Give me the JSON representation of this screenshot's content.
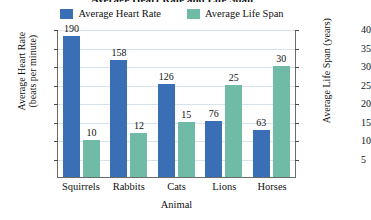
{
  "chart_data": {
    "type": "bar",
    "title": "Average Heart Rate and Life Span",
    "xlabel": "Animal",
    "categories": [
      "Squirrels",
      "Rabbits",
      "Cats",
      "Lions",
      "Horses"
    ],
    "series": [
      {
        "name": "Average Heart Rate",
        "color": "#3a6fb5",
        "axis": "left",
        "ylabel": "Average Heart Rate (beats per minute)",
        "ylim": [
          0,
          200
        ],
        "ticks": [
          200,
          175,
          150,
          125,
          100,
          75,
          50,
          25
        ],
        "values": [
          190,
          158,
          126,
          76,
          63
        ]
      },
      {
        "name": "Average Life Span",
        "color": "#70bba6",
        "axis": "right",
        "ylabel": "Average Life Span (years)",
        "ylim": [
          0,
          40
        ],
        "ticks": [
          40,
          35,
          30,
          25,
          20,
          15,
          10,
          5
        ],
        "values": [
          10,
          12,
          15,
          25,
          30
        ]
      }
    ],
    "grid": true,
    "legend_position": "top-center"
  },
  "axes": {
    "left_title_line1": "Average Heart Rate",
    "left_title_line2": "(beats per minute)",
    "right_title": "Average Life Span (years)",
    "x_title": "Animal",
    "left_ticks": [
      "200",
      "175",
      "150",
      "125",
      "100",
      "75",
      "50",
      "25"
    ],
    "right_ticks": [
      "40",
      "35",
      "30",
      "25",
      "20",
      "15",
      "10",
      "5"
    ]
  },
  "legend": {
    "items": [
      {
        "label": "Average Heart Rate",
        "color": "#3a6fb5"
      },
      {
        "label": "Average Life Span",
        "color": "#70bba6"
      }
    ]
  },
  "bars": {
    "heart_rate_labels": [
      "190",
      "158",
      "126",
      "76",
      "63"
    ],
    "life_span_labels": [
      "10",
      "12",
      "15",
      "25",
      "30"
    ]
  }
}
